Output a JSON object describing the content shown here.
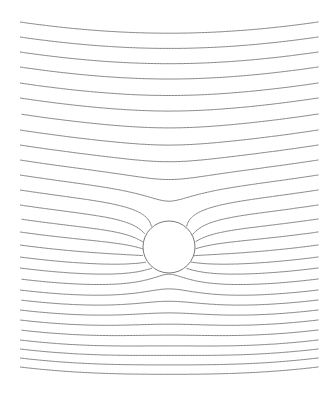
{
  "diagram": {
    "background": "#ffffff",
    "line_color": "#7a7a7a",
    "canvas": {
      "width": 336,
      "height": 396
    },
    "x_range": [
      20,
      318
    ],
    "cylinder": {
      "cx": 169,
      "cy": 247,
      "r": 26
    },
    "stagnation_point": {
      "x": 168,
      "y": 222
    },
    "field": {
      "sag": 0.00045
    },
    "levels_above": [
      22,
      37,
      52,
      67,
      83,
      98,
      114,
      130,
      145,
      160,
      175
    ],
    "levels_separatrix": [
      190
    ],
    "levels_below": [
      205,
      219,
      232,
      245,
      257,
      268,
      279,
      290,
      300,
      310,
      320,
      330,
      340,
      349,
      358,
      367
    ]
  }
}
